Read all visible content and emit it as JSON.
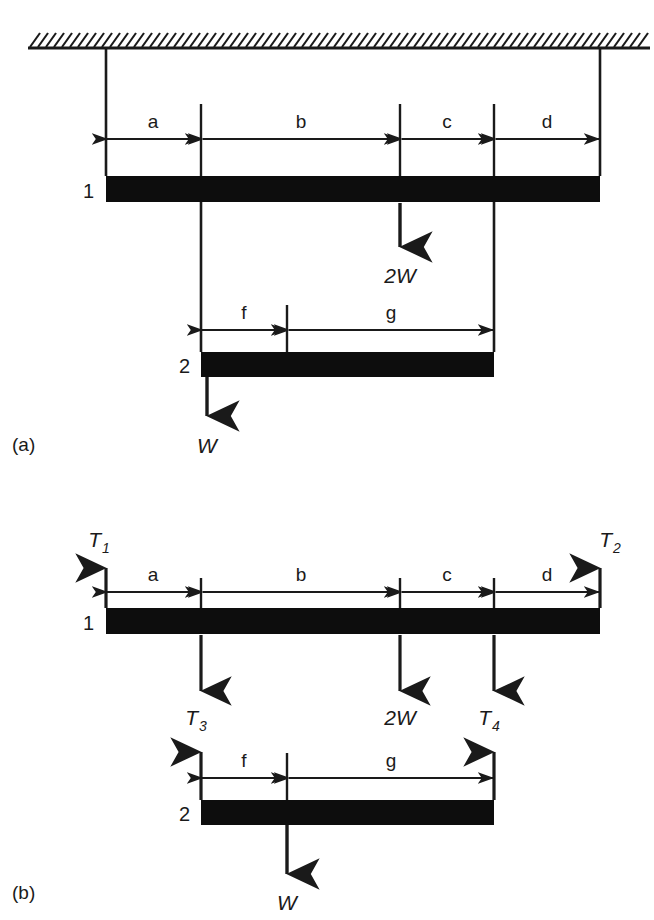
{
  "figure": {
    "panels": [
      {
        "id": "a",
        "label": "(a)",
        "description": "Suspended beam system attached to ceiling",
        "ceiling": {
          "hatch_icon": "hatch-ceiling",
          "present": true
        },
        "beams": [
          {
            "name": "1",
            "label": "1"
          },
          {
            "name": "2",
            "label": "2"
          }
        ],
        "dimensions_beam1": [
          "a",
          "b",
          "c",
          "d"
        ],
        "dimensions_beam2": [
          "f",
          "g"
        ],
        "loads": [
          {
            "name": "load-2W",
            "label": "2W",
            "direction": "down"
          },
          {
            "name": "load-W",
            "label": "W",
            "direction": "down"
          }
        ]
      },
      {
        "id": "b",
        "label": "(b)",
        "description": "Free-body diagram with tension forces",
        "beams": [
          {
            "name": "1",
            "label": "1"
          },
          {
            "name": "2",
            "label": "2"
          }
        ],
        "dimensions_beam1": [
          "a",
          "b",
          "c",
          "d"
        ],
        "dimensions_beam2": [
          "f",
          "g"
        ],
        "forces": [
          {
            "name": "T1",
            "base": "T",
            "sub": "1",
            "direction": "up"
          },
          {
            "name": "T2",
            "base": "T",
            "sub": "2",
            "direction": "up"
          },
          {
            "name": "T3",
            "base": "T",
            "sub": "3",
            "direction": "down"
          },
          {
            "name": "T4",
            "base": "T",
            "sub": "4",
            "direction": "down"
          },
          {
            "name": "2W",
            "label": "2W",
            "direction": "down"
          },
          {
            "name": "W",
            "label": "W",
            "direction": "down"
          }
        ]
      }
    ]
  },
  "labels": {
    "a": "a",
    "b": "b",
    "c": "c",
    "d": "d",
    "f": "f",
    "g": "g",
    "beam1": "1",
    "beam2": "2",
    "twoW": "2W",
    "W": "W",
    "T": "T",
    "sub1": "1",
    "sub2": "2",
    "sub3": "3",
    "sub4": "4",
    "panel_a": "(a)",
    "panel_b": "(b)"
  },
  "colors": {
    "beam_fill": "#0d0d0d",
    "line": "#1a1a1a",
    "background": "#ffffff",
    "text": "#1a1a1a"
  }
}
